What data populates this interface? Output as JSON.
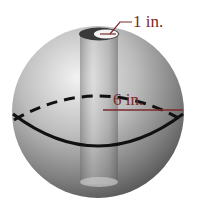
{
  "diagram": {
    "labels": {
      "hole_radius": "1 in.",
      "sphere_radius": "6 in."
    },
    "colors": {
      "label": "#7a2a2a",
      "equator": "#111111",
      "sphere_light": "#e8e8e8",
      "sphere_dark": "#5a5a5a"
    }
  }
}
